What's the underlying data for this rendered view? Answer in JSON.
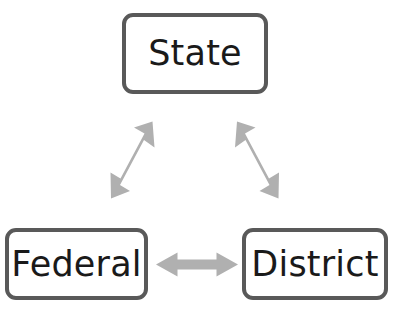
{
  "diagram": {
    "background_color": "#ffffff",
    "node_border_color": "#595959",
    "node_fill_color": "#ffffff",
    "node_text_color": "#1a1a1a",
    "arrow_color": "#b0b0b0",
    "nodes": [
      {
        "id": "state",
        "label": "State"
      },
      {
        "id": "federal",
        "label": "Federal"
      },
      {
        "id": "district",
        "label": "District"
      }
    ],
    "connectors": [
      {
        "id": "federal-state",
        "from": "Federal",
        "to": "State",
        "direction": "bidirectional",
        "orientation": "diagonal-up-right"
      },
      {
        "id": "state-district",
        "from": "State",
        "to": "District",
        "direction": "bidirectional",
        "orientation": "diagonal-down-right"
      },
      {
        "id": "federal-district",
        "from": "Federal",
        "to": "District",
        "direction": "bidirectional",
        "orientation": "horizontal"
      }
    ]
  }
}
